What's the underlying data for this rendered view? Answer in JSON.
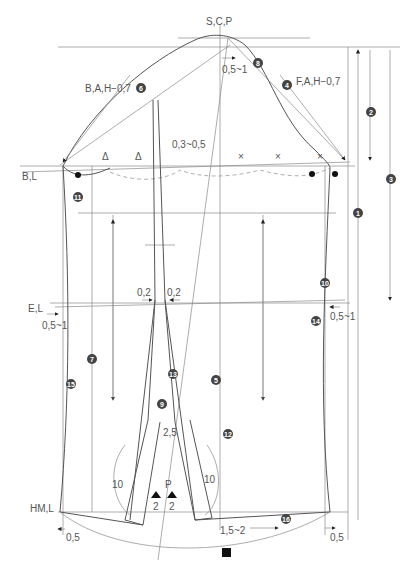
{
  "diagram": {
    "type": "sewing-pattern-sleeve-draft",
    "labels": {
      "scp": "S,C,P",
      "bah": "B,A,H−0,7",
      "fah": "F,A,H−0,7",
      "bl": "B,L",
      "el": "E,L",
      "hml": "HM,L",
      "ease_top": "0,5~1",
      "ease_03": "0,3~0,5",
      "el_left": "0,5~1",
      "el_right": "0,5~1",
      "dart_left": "0,2",
      "dart_right": "0,2",
      "slit_top": "2,5",
      "slit_left_len": "10",
      "slit_right_len": "10",
      "p": "P",
      "p_left": "2",
      "p_right": "2",
      "hem_left": "0,5",
      "hem_right": "0,5",
      "hem_shift": "1,5~2",
      "triangle_mark": "Δ",
      "cross_mark": "×"
    },
    "markers": {
      "n1": "1",
      "n2": "2",
      "n3": "3",
      "n4": "4",
      "n5": "5",
      "n6": "6",
      "n7": "7",
      "n8": "8",
      "n9": "9",
      "n10": "10",
      "n11": "11",
      "n12": "12",
      "n13": "13",
      "n14": "14",
      "n15": "15",
      "n16": "16"
    }
  }
}
